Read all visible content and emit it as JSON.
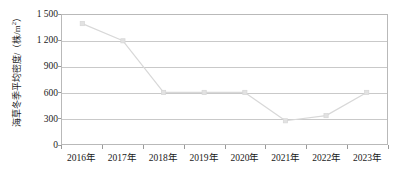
{
  "chart_data": {
    "type": "line",
    "title": "",
    "xlabel": "",
    "ylabel": "海草冬季平均密度/（株/m²）",
    "ylabel_text": "海草冬季平均密度/（株/m",
    "ylabel_sup": "2",
    "ylabel_tail": "）",
    "categories": [
      "2016年",
      "2017年",
      "2018年",
      "2019年",
      "2020年",
      "2021年",
      "2022年",
      "2023年"
    ],
    "values": [
      1400,
      1200,
      600,
      600,
      600,
      270,
      330,
      600
    ],
    "ylim": [
      0,
      1500
    ],
    "ytick_values": [
      0,
      300,
      600,
      900,
      1200,
      1500
    ],
    "ytick_labels": [
      "0",
      "300",
      "600",
      "900",
      "1 200",
      "1 500"
    ],
    "grid": "horizontal",
    "legend": "none",
    "series_name": "海草冬季平均密度",
    "line_color": "#d8d8d8",
    "marker_color": "#e2e2e2",
    "marker_shape": "square",
    "gridline_color": "#c9c9c9",
    "frame_color": "#b9b9b9",
    "background_color": "#ffffff",
    "text_color": "#1a1a1a"
  }
}
